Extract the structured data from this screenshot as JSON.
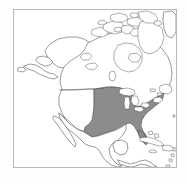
{
  "figure": {
    "type": "map",
    "projection_appearance": "polar-ish conic, North America centered",
    "frame": {
      "visible": true,
      "border_color": "#b9b9b9",
      "background_color": "#ffffff",
      "left": 13,
      "top": 9,
      "width": 164,
      "height": 159
    },
    "page_background": "#fefefe"
  },
  "map": {
    "region_shown": "North America",
    "title": "",
    "caption": "",
    "legend": {
      "visible": false,
      "entries": [
        {
          "label": "Highlighted country",
          "color": "#8c8c8c"
        },
        {
          "label": "Other land",
          "color": "#ffffff"
        }
      ]
    },
    "styles": {
      "land_fill": "#ffffff",
      "land_stroke": "#4a4a4a",
      "highlight_fill": "#8c8c8c",
      "highlight_stroke": "#4a4a4a",
      "water_fill": "#ffffff",
      "lake_fill": "#ffffff",
      "internal_border_stroke": "#5a5a5a"
    },
    "highlighted": {
      "name": "United States (central and eastern contiguous area)",
      "fill": "#8c8c8c",
      "shown_as": "solid gray shaded polygon"
    },
    "features": [
      {
        "name": "Alaska",
        "highlighted": false
      },
      {
        "name": "Canada",
        "highlighted": false
      },
      {
        "name": "Canadian Arctic Archipelago",
        "highlighted": false
      },
      {
        "name": "Greenland (western edge)",
        "highlighted": false
      },
      {
        "name": "Western United States",
        "highlighted": false
      },
      {
        "name": "Central and Eastern United States",
        "highlighted": true
      },
      {
        "name": "Mexico",
        "highlighted": false
      },
      {
        "name": "Baja California",
        "highlighted": false
      },
      {
        "name": "Yucatan Peninsula",
        "highlighted": false
      },
      {
        "name": "Central America",
        "highlighted": false
      },
      {
        "name": "Cuba",
        "highlighted": false
      },
      {
        "name": "Hispaniola",
        "highlighted": false
      },
      {
        "name": "Lesser Antilles",
        "highlighted": false
      },
      {
        "name": "Great Lakes",
        "highlighted": false
      },
      {
        "name": "Newfoundland",
        "highlighted": false
      },
      {
        "name": "Florida Peninsula",
        "highlighted": true
      }
    ]
  }
}
